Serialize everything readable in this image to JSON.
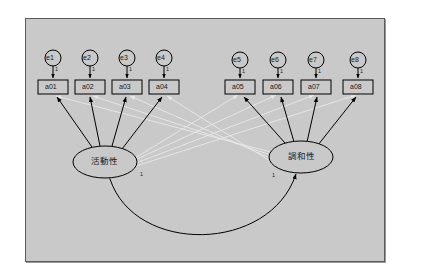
{
  "diagram": {
    "type": "sem-path-diagram",
    "panel_color": "#c9c9c9",
    "border_color": "#5a5a5a",
    "path_color": "#000000",
    "crossload_color": "#e8e8e8",
    "fixed_loading_label": "1",
    "factors": [
      {
        "id": "f1",
        "label": "活動性",
        "cx": 105,
        "cy": 162,
        "rx": 32,
        "ry": 16,
        "one_label": "1",
        "one_x": 140,
        "one_y": 174
      },
      {
        "id": "f2",
        "label": "調和性",
        "cx": 301,
        "cy": 157,
        "rx": 32,
        "ry": 16,
        "one_label": "1",
        "one_x": 272,
        "one_y": 175
      }
    ],
    "indicators": [
      {
        "id": "a01",
        "label": "a01",
        "x": 38,
        "y": 80,
        "w": 30,
        "h": 14,
        "factor": "f1"
      },
      {
        "id": "a02",
        "label": "a02",
        "x": 75,
        "y": 80,
        "w": 30,
        "h": 14,
        "factor": "f1"
      },
      {
        "id": "a03",
        "label": "a03",
        "x": 112,
        "y": 80,
        "w": 30,
        "h": 14,
        "factor": "f1"
      },
      {
        "id": "a04",
        "label": "a04",
        "x": 149,
        "y": 80,
        "w": 30,
        "h": 14,
        "factor": "f1"
      },
      {
        "id": "a05",
        "label": "a05",
        "x": 225,
        "y": 80,
        "w": 30,
        "h": 14,
        "factor": "f2"
      },
      {
        "id": "a06",
        "label": "a06",
        "x": 263,
        "y": 80,
        "w": 30,
        "h": 14,
        "factor": "f2"
      },
      {
        "id": "a07",
        "label": "a07",
        "x": 301,
        "y": 80,
        "w": 30,
        "h": 14,
        "factor": "f2"
      },
      {
        "id": "a08",
        "label": "a08",
        "x": 343,
        "y": 80,
        "w": 30,
        "h": 14,
        "factor": "f2"
      }
    ],
    "errors": [
      {
        "id": "e1",
        "label": "e1",
        "cx": 53,
        "cy": 58,
        "r": 8,
        "target": "a01",
        "one_label": "1"
      },
      {
        "id": "e2",
        "label": "e2",
        "cx": 90,
        "cy": 58,
        "r": 8,
        "target": "a02",
        "one_label": "1"
      },
      {
        "id": "e3",
        "label": "e3",
        "cx": 127,
        "cy": 58,
        "r": 8,
        "target": "a03",
        "one_label": "1"
      },
      {
        "id": "e4",
        "label": "e4",
        "cx": 164,
        "cy": 58,
        "r": 8,
        "target": "a04",
        "one_label": "1"
      },
      {
        "id": "e5",
        "label": "e5",
        "cx": 240,
        "cy": 60,
        "r": 8,
        "target": "a05",
        "one_label": "1"
      },
      {
        "id": "e6",
        "label": "e6",
        "cx": 278,
        "cy": 60,
        "r": 8,
        "target": "a06",
        "one_label": "1"
      },
      {
        "id": "e7",
        "label": "e7",
        "cx": 316,
        "cy": 60,
        "r": 8,
        "target": "a07",
        "one_label": "1"
      },
      {
        "id": "e8",
        "label": "e8",
        "cx": 358,
        "cy": 60,
        "r": 8,
        "target": "a08",
        "one_label": "1"
      }
    ],
    "covariance": {
      "label": "",
      "from": "f1",
      "to": "f2",
      "style": "double-headed-curve"
    }
  }
}
